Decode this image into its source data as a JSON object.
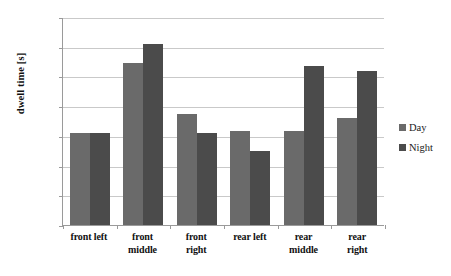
{
  "chart_data": {
    "type": "bar",
    "title": "",
    "xlabel": "",
    "ylabel": "dwell time [s]",
    "ylim": [
      0,
      0.7
    ],
    "grid": true,
    "legend_position": "right",
    "decimal_separator": ",",
    "categories": [
      "front left",
      "front middle",
      "front right",
      "rear left",
      "rear middle",
      "rear right"
    ],
    "category_lines": [
      [
        "front left",
        ""
      ],
      [
        "front",
        "middle"
      ],
      [
        "front",
        "right"
      ],
      [
        "rear left",
        ""
      ],
      [
        "rear",
        "middle"
      ],
      [
        "rear",
        "right"
      ]
    ],
    "ytick_labels": [
      "0,7",
      "0,6",
      "0,5",
      "0,4",
      "0,3",
      "0,2",
      "0,1",
      "0"
    ],
    "ytick_values": [
      0.7,
      0.6,
      0.5,
      0.4,
      0.3,
      0.2,
      0.1,
      0
    ],
    "series": [
      {
        "name": "Day",
        "color": "#6a6a6a",
        "values": [
          0.31,
          0.545,
          0.375,
          0.315,
          0.315,
          0.36
        ]
      },
      {
        "name": "Night",
        "color": "#4b4b4b",
        "values": [
          0.31,
          0.61,
          0.31,
          0.25,
          0.535,
          0.52
        ]
      }
    ]
  },
  "legend": {
    "items": [
      {
        "label": "Day",
        "swatch": "day-swatch-icon"
      },
      {
        "label": "Night",
        "swatch": "night-swatch-icon"
      }
    ]
  }
}
